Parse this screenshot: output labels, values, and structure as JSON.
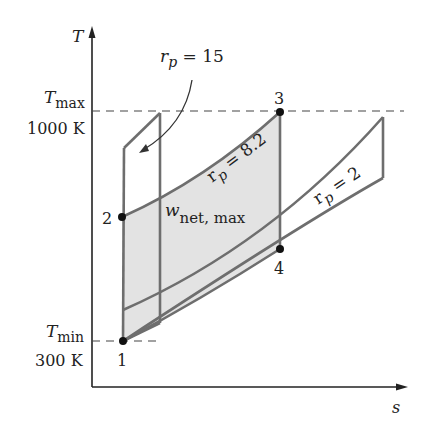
{
  "axes": {
    "y_label": "T",
    "x_label": "s"
  },
  "levels": {
    "tmax_label": "T",
    "tmax_sub": "max",
    "tmax_value": "1000 K",
    "tmin_label": "T",
    "tmin_sub": "min",
    "tmin_value": "300 K"
  },
  "points": [
    {
      "id": "1",
      "label": "1"
    },
    {
      "id": "2",
      "label": "2"
    },
    {
      "id": "3",
      "label": "3"
    },
    {
      "id": "4",
      "label": "4"
    }
  ],
  "cycles": [
    {
      "name": "rp15",
      "label_main": "r",
      "label_sub": "p",
      "label_eq": " = 15"
    },
    {
      "name": "rp82",
      "label_main": "r",
      "label_sub": "p",
      "label_eq": " = 8.2"
    },
    {
      "name": "rp2",
      "label_main": "r",
      "label_sub": "p",
      "label_eq": " = 2"
    }
  ],
  "area": {
    "label_main": "w",
    "label_sub": "net, max"
  },
  "colors": {
    "line": "#6e6e6e",
    "axis": "#222222",
    "shade": "#e3e3e3",
    "point": "#111111"
  }
}
